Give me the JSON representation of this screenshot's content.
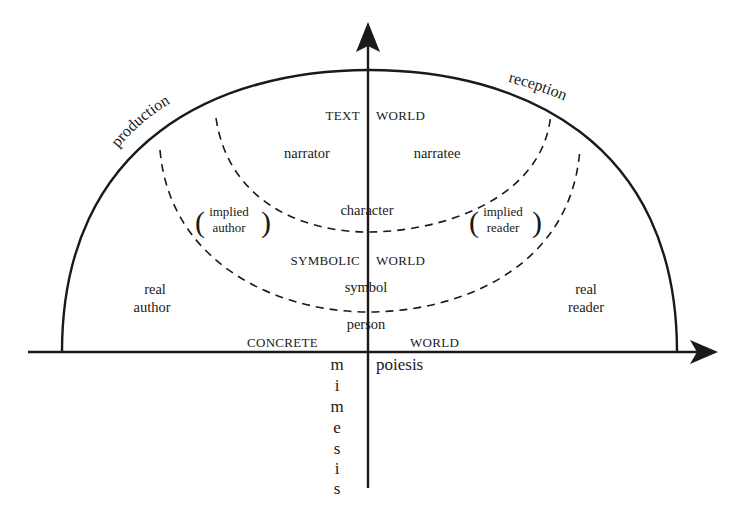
{
  "diagram": {
    "axes": {
      "horizontal_label_right": "poiesis",
      "vertical_label_letters": [
        "m",
        "i",
        "m",
        "e",
        "s",
        "i",
        "s"
      ],
      "vertical_label": "mimesis"
    },
    "arc_labels": {
      "left": "production",
      "right": "reception"
    },
    "worlds": {
      "text": {
        "left": "TEXT",
        "right": "WORLD"
      },
      "symbolic": {
        "left": "SYMBOLIC",
        "right": "WORLD"
      },
      "concrete": {
        "left": "CONCRETE",
        "right": "WORLD"
      }
    },
    "text_world_entities": {
      "narrator": "narrator",
      "narratee": "narratee",
      "character": "character"
    },
    "symbolic_world_entities": {
      "implied_author": {
        "line1": "implied",
        "line2": "author"
      },
      "implied_reader": {
        "line1": "implied",
        "line2": "reader"
      },
      "symbol": "symbol"
    },
    "concrete_world_entities": {
      "real_author": {
        "line1": "real",
        "line2": "author"
      },
      "real_reader": {
        "line1": "real",
        "line2": "reader"
      },
      "person": "person"
    },
    "colors": {
      "ink": "#1a1a1a",
      "background": "#ffffff"
    }
  }
}
